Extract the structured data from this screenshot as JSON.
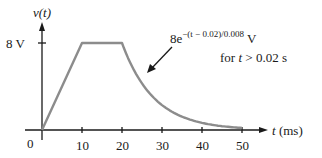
{
  "chart_data": {
    "type": "line",
    "title": "",
    "ylabel": "v(t)",
    "xlabel": "t (ms)",
    "x_ticks": [
      10,
      20,
      30,
      40,
      50
    ],
    "y_ticks": [
      "8 V"
    ],
    "origin_label": "0",
    "xlim": [
      0,
      50
    ],
    "ylim": [
      0,
      8
    ],
    "series": [
      {
        "name": "v(t)",
        "segments": [
          {
            "type": "linear",
            "x": [
              0,
              10
            ],
            "y": [
              0,
              8
            ]
          },
          {
            "type": "constant",
            "x": [
              10,
              20
            ],
            "y": [
              8,
              8
            ]
          },
          {
            "type": "exponential",
            "expression": "8e^{-(t-0.02)/0.008} V",
            "x": [
              20,
              50
            ],
            "y_start": 8,
            "y_end": 0.19
          }
        ]
      }
    ],
    "annotations": [
      {
        "text_base": "8e",
        "text_exp": "−(t − 0.02)/0.008",
        "text_unit": " V",
        "condition": "for t > 0.02 s"
      }
    ],
    "grid": false,
    "legend": null
  },
  "labels": {
    "y_axis": "v(t)",
    "y_tick": "8 V",
    "origin": "0",
    "x_axis": "t (ms)",
    "x_ticks": [
      "10",
      "20",
      "30",
      "40",
      "50"
    ],
    "annot_base": "8e",
    "annot_exp": "−(t − 0.02)/0.008",
    "annot_unit": " V",
    "annot_cond_pre": "for ",
    "annot_cond_t": "t",
    "annot_cond_post": " > 0.02 s"
  },
  "colors": {
    "curve": "#8c8c8c",
    "axes": "#1a1a1a"
  }
}
